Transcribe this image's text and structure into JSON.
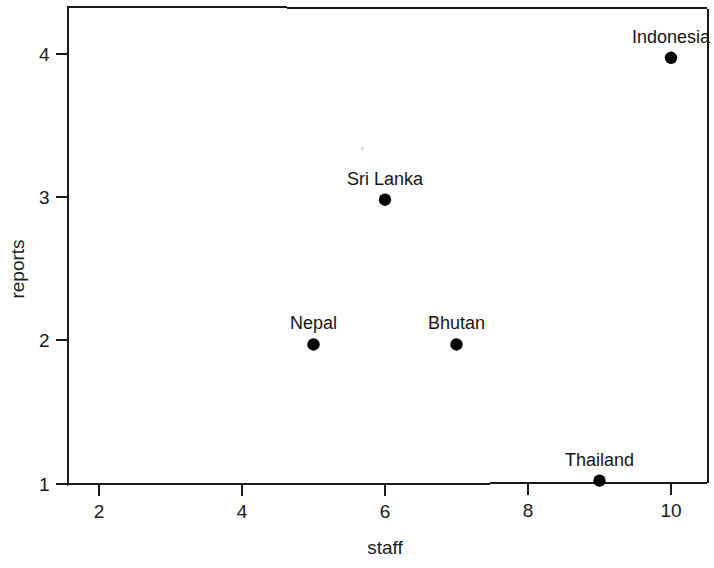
{
  "chart_data": {
    "type": "scatter",
    "title": "",
    "xlabel": "staff",
    "ylabel": "reports",
    "xlim": [
      1.6,
      10.5
    ],
    "ylim": [
      0.99,
      4.25
    ],
    "grid": false,
    "legend": null,
    "xticks": [
      2,
      4,
      6,
      8,
      10
    ],
    "xtick_labels": [
      "2",
      "4",
      "6",
      "8",
      "10"
    ],
    "yticks": [
      1,
      2,
      3,
      4
    ],
    "ytick_labels": [
      "1",
      "2",
      "3",
      "4"
    ],
    "marker": "filled-circle",
    "marker_color": "#000000",
    "points": [
      {
        "label": "Indonesia",
        "x": 10,
        "y": 3.97,
        "label_position": "above"
      },
      {
        "label": "Sri Lanka",
        "x": 6,
        "y": 2.98,
        "label_position": "above"
      },
      {
        "label": "Bhutan",
        "x": 7,
        "y": 1.97,
        "label_position": "above"
      },
      {
        "label": "Nepal",
        "x": 5,
        "y": 1.97,
        "label_position": "above"
      },
      {
        "label": "Thailand",
        "x": 9,
        "y": 1.02,
        "label_position": "above"
      }
    ]
  },
  "axes": {
    "x_title": "staff",
    "y_title": "reports"
  },
  "colors": {
    "frame": "#1a1a1a",
    "marker": "#000000",
    "background": "#ffffff",
    "text": "#141414"
  }
}
